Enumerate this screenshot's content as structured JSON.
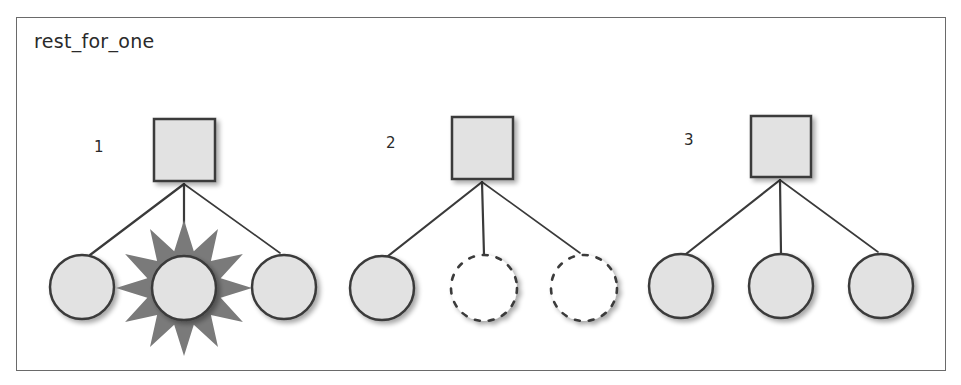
{
  "title": "rest_for_one",
  "colors": {
    "frame": "#6a6a6a",
    "node_fill": "#e2e2e2",
    "node_stroke": "#3a3a3a",
    "crash_star": "#7a7a7a",
    "shadow": "#bdbdbd"
  },
  "steps": [
    {
      "label": "1",
      "label_pos": [
        94,
        138
      ],
      "supervisor": {
        "x": 154,
        "y": 119,
        "w": 61,
        "h": 62
      },
      "hub": [
        184,
        184
      ],
      "children": [
        {
          "cx": 82,
          "cy": 287,
          "r": 32,
          "state": "running",
          "attach": [
            90,
            255
          ]
        },
        {
          "cx": 184,
          "cy": 288,
          "r": 32,
          "state": "crashed",
          "attach": [
            184,
            256
          ]
        },
        {
          "cx": 284,
          "cy": 287,
          "r": 32,
          "state": "running",
          "attach": [
            280,
            253
          ]
        }
      ]
    },
    {
      "label": "2",
      "label_pos": [
        386,
        134
      ],
      "supervisor": {
        "x": 452,
        "y": 117,
        "w": 61,
        "h": 62
      },
      "hub": [
        482,
        182
      ],
      "children": [
        {
          "cx": 382,
          "cy": 288,
          "r": 32,
          "state": "running",
          "attach": [
            388,
            256
          ]
        },
        {
          "cx": 484,
          "cy": 288,
          "r": 33,
          "state": "terminated",
          "attach": [
            484,
            255
          ]
        },
        {
          "cx": 584,
          "cy": 288,
          "r": 33,
          "state": "terminated",
          "attach": [
            580,
            253
          ]
        }
      ]
    },
    {
      "label": "3",
      "label_pos": [
        684,
        131
      ],
      "supervisor": {
        "x": 751,
        "y": 116,
        "w": 60,
        "h": 61
      },
      "hub": [
        780,
        180
      ],
      "children": [
        {
          "cx": 681,
          "cy": 286,
          "r": 32,
          "state": "running",
          "attach": [
            686,
            254
          ]
        },
        {
          "cx": 781,
          "cy": 286,
          "r": 32,
          "state": "restarted",
          "attach": [
            781,
            254
          ]
        },
        {
          "cx": 881,
          "cy": 286,
          "r": 32,
          "state": "restarted",
          "attach": [
            878,
            252
          ]
        }
      ]
    }
  ]
}
